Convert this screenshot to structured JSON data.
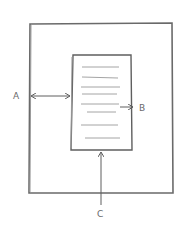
{
  "diagram": {
    "style": "hand-drawn pencil sketch",
    "colors": {
      "stroke": "#5f5f5f",
      "light_stroke": "#9a9a9a",
      "background": "#ffffff"
    },
    "outer_frame": {
      "x": 29,
      "y": 23,
      "width": 144,
      "height": 170
    },
    "content_box": {
      "x": 71,
      "y": 55,
      "width": 60,
      "height": 95
    },
    "text_lines_y": [
      67,
      77,
      87,
      94,
      104,
      112,
      125,
      138
    ],
    "labels": {
      "a": "A",
      "b": "B",
      "c": "C"
    },
    "arrows": [
      {
        "id": "a",
        "type": "double",
        "from": [
          30,
          96
        ],
        "to": [
          70,
          96
        ],
        "meaning": "margin between outer frame left edge and content box"
      },
      {
        "id": "b",
        "type": "single",
        "from": [
          120,
          107
        ],
        "to": [
          133,
          107
        ],
        "meaning": "points to right edge of content box"
      },
      {
        "id": "c",
        "type": "single",
        "from": [
          101,
          205
        ],
        "to": [
          101,
          151
        ],
        "meaning": "points up to bottom of content box"
      }
    ]
  }
}
